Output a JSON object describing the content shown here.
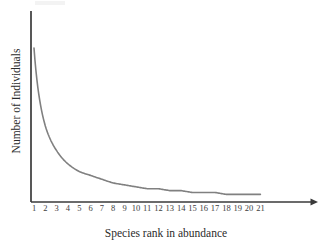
{
  "chart_data": {
    "type": "line",
    "title": "",
    "subtitle": "",
    "xlabel": "Species rank in abundance",
    "ylabel": "Number of Individuals",
    "grid": false,
    "legend": null,
    "legend_position": "none",
    "xlim": [
      0.6,
      21.6
    ],
    "ylim": [
      0,
      100
    ],
    "x_tick_labels": [
      "1",
      "2",
      "3",
      "4",
      "5",
      "6",
      "7",
      "8",
      "9",
      "10",
      "11",
      "12",
      "13",
      "14",
      "15",
      "16",
      "17",
      "18",
      "19",
      "20",
      "21"
    ],
    "y_tick_labels": [],
    "annotations": [],
    "series": [
      {
        "name": "rank-abundance",
        "color": "#808080",
        "line_width": 1.6,
        "x": [
          1,
          2,
          3,
          4,
          5,
          6,
          7,
          8,
          9,
          10,
          11,
          12,
          13,
          14,
          15,
          16,
          17,
          18,
          19,
          20,
          21
        ],
        "values": [
          81,
          40,
          27,
          20,
          16,
          14,
          12,
          10,
          9,
          8,
          7,
          7,
          6,
          6,
          5,
          5,
          5,
          4,
          4,
          4,
          4
        ]
      }
    ]
  },
  "axes": {
    "x_axis_color": "#3a3a3a",
    "y_axis_color": "#3a3a3a",
    "x_axis_has_arrow": true,
    "y_axis_has_arrow": false
  },
  "ticks": [
    {
      "label": "1"
    },
    {
      "label": "2"
    },
    {
      "label": "3"
    },
    {
      "label": "4"
    },
    {
      "label": "5"
    },
    {
      "label": "6"
    },
    {
      "label": "7"
    },
    {
      "label": "8"
    },
    {
      "label": "9"
    },
    {
      "label": "10"
    },
    {
      "label": "11"
    },
    {
      "label": "12"
    },
    {
      "label": "13"
    },
    {
      "label": "14"
    },
    {
      "label": "15"
    },
    {
      "label": "16"
    },
    {
      "label": "17"
    },
    {
      "label": "18"
    },
    {
      "label": "19"
    },
    {
      "label": "20"
    },
    {
      "label": "21"
    }
  ]
}
